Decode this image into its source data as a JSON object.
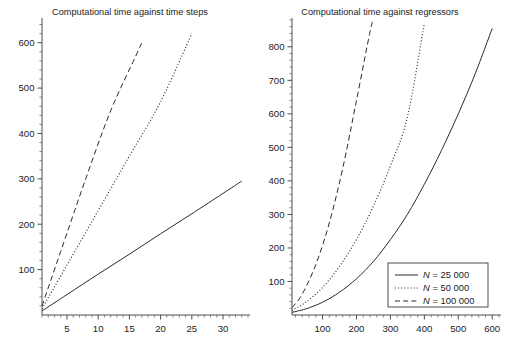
{
  "figure": {
    "background": "#ffffff",
    "ink": "#2b2b2b",
    "panel_count": 2
  },
  "chart_data": [
    {
      "id": "left",
      "type": "line",
      "title": "Computational time against time steps",
      "xlabel": "",
      "ylabel": "",
      "xlim": [
        1,
        34
      ],
      "ylim": [
        0,
        650
      ],
      "grid": false,
      "legend": "none",
      "xticks": [
        5,
        10,
        15,
        20,
        25,
        30
      ],
      "xticklabels": [
        "5",
        "10",
        "15",
        "20",
        "25",
        "30"
      ],
      "xminor_step": 1,
      "yticks": [
        100,
        200,
        300,
        400,
        500,
        600
      ],
      "yticklabels": [
        "100",
        "200",
        "300",
        "400",
        "500",
        "600"
      ],
      "yminor_step": 20,
      "series": [
        {
          "name": "N = 25 000",
          "style": "solid",
          "x": [
            1,
            5,
            10,
            15,
            20,
            25,
            30,
            33
          ],
          "values": [
            9,
            45,
            90,
            134,
            179,
            223,
            268,
            295
          ]
        },
        {
          "name": "N = 50 000",
          "style": "dotted",
          "x": [
            1,
            5,
            10,
            15,
            20,
            25
          ],
          "values": [
            14,
            110,
            230,
            350,
            470,
            620
          ]
        },
        {
          "name": "N = 100 000",
          "style": "dashed",
          "x": [
            1,
            4,
            8,
            12,
            16,
            17
          ],
          "values": [
            20,
            140,
            300,
            450,
            570,
            600
          ]
        }
      ]
    },
    {
      "id": "right",
      "type": "line",
      "title": "Computational time against regressors",
      "xlabel": "",
      "ylabel": "",
      "xlim": [
        10,
        620
      ],
      "ylim": [
        0,
        880
      ],
      "grid": false,
      "legend": "lower right",
      "xticks": [
        100,
        200,
        300,
        400,
        500,
        600
      ],
      "xticklabels": [
        "100",
        "200",
        "300",
        "400",
        "500",
        "600"
      ],
      "xminor_step": 20,
      "yticks": [
        100,
        200,
        300,
        400,
        500,
        600,
        700,
        800
      ],
      "yticklabels": [
        "100",
        "200",
        "300",
        "400",
        "500",
        "600",
        "700",
        "800"
      ],
      "yminor_step": 20,
      "series": [
        {
          "name": "N = 25 000",
          "style": "solid",
          "x": [
            10,
            50,
            100,
            150,
            200,
            250,
            300,
            350,
            400,
            450,
            500,
            550,
            600
          ],
          "values": [
            8,
            18,
            38,
            68,
            108,
            160,
            225,
            300,
            390,
            490,
            600,
            720,
            855
          ]
        },
        {
          "name": "N = 50 000",
          "style": "dotted",
          "x": [
            10,
            50,
            100,
            150,
            200,
            250,
            300,
            350,
            400
          ],
          "values": [
            14,
            38,
            82,
            145,
            225,
            325,
            445,
            590,
            870
          ]
        },
        {
          "name": "N = 100 000",
          "style": "dashed",
          "x": [
            10,
            40,
            80,
            120,
            160,
            200,
            240,
            250
          ],
          "values": [
            22,
            62,
            150,
            275,
            440,
            640,
            845,
            880
          ]
        }
      ]
    }
  ],
  "legend": {
    "title": "",
    "entries": [
      {
        "label": "N = 25 000",
        "symbol": "N",
        "value": "= 25 000",
        "style": "solid"
      },
      {
        "label": "N = 50 000",
        "symbol": "N",
        "value": "= 50 000",
        "style": "dotted"
      },
      {
        "label": "N = 100 000",
        "symbol": "N",
        "value": "= 100 000",
        "style": "dashed"
      }
    ]
  }
}
